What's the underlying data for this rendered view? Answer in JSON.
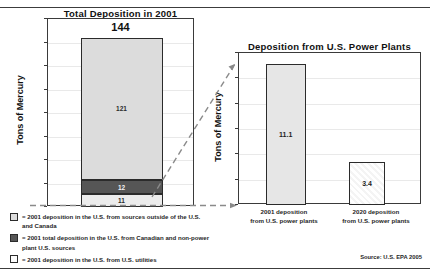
{
  "figure": {
    "source_note": "Source: U.S. EPA 2005"
  },
  "chart_data": [
    {
      "id": "total-deposition",
      "type": "bar",
      "title": "Total Deposition in 2001",
      "xlabel": "",
      "ylabel": "Tons of Mercury",
      "ylim": [
        0,
        160
      ],
      "ytick_step": 20,
      "yticks": [
        "0",
        "20",
        "40",
        "60",
        "80",
        "100",
        "120",
        "140",
        "160"
      ],
      "grid": true,
      "stacked": true,
      "categories": [
        "2001"
      ],
      "total_label": "144",
      "total_value": 144,
      "series": [
        {
          "name": "2001 deposition in the U.S. from sources outside of the U.S. and Canada",
          "value": 121,
          "label": "121",
          "color": "#dcdcdc"
        },
        {
          "name": "2001 total deposition in the U.S. from Canadian and non-power plant U.S. sources",
          "value": 12,
          "label": "12",
          "color": "#565656"
        },
        {
          "name": "2001 deposition in the U.S. from U.S. utilities",
          "value": 11,
          "label": "11",
          "color": "#ececec"
        }
      ]
    },
    {
      "id": "power-plant-deposition",
      "type": "bar",
      "title": "Deposition from U.S. Power Plants",
      "xlabel": "",
      "ylabel": "Tons of Mercury",
      "ylim": [
        0,
        12
      ],
      "ytick_step": 2,
      "yticks": [
        "0",
        "2",
        "4",
        "6",
        "8",
        "10",
        "12"
      ],
      "grid": true,
      "categories": [
        "2001 deposition\nfrom U.S. power plants",
        "2020 deposition\nfrom U.S. power plants"
      ],
      "bars": [
        {
          "category_line1": "2001 deposition",
          "category_line2": "from U.S. power plants",
          "value": 11.1,
          "label": "11.1",
          "fill": "solid"
        },
        {
          "category_line1": "2020 deposition",
          "category_line2": "from U.S. power plants",
          "value": 3.4,
          "label": "3.4",
          "fill": "hatched"
        }
      ]
    }
  ],
  "legend": {
    "items": [
      {
        "swatch": "light-gray",
        "text": "= 2001 deposition in the U.S. from sources outside of the U.S. and Canada"
      },
      {
        "swatch": "dark-gray",
        "text": "= 2001 total deposition in the U.S. from Canadian and non-power plant U.S. sources"
      },
      {
        "swatch": "white",
        "text": "= 2001 deposition in the U.S. from U.S. utilities"
      }
    ]
  }
}
